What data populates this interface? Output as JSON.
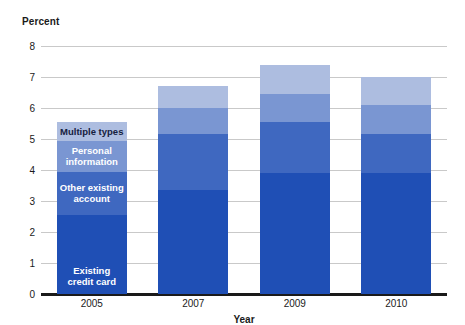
{
  "chart_data": {
    "type": "bar",
    "subtype": "stacked-bar",
    "title": "",
    "xlabel": "Year",
    "ylabel": "Percent",
    "categories": [
      "2005",
      "2007",
      "2009",
      "2010"
    ],
    "ylim": [
      0,
      8
    ],
    "yticks": [
      0,
      1,
      2,
      3,
      4,
      5,
      6,
      7,
      8
    ],
    "ytick_labels": [
      "0",
      "1",
      "2",
      "3",
      "4",
      "5",
      "6",
      "7",
      "8"
    ],
    "grid": true,
    "legend_position": "in-bar-2005",
    "series": [
      {
        "name": "Existing credit card",
        "color": "#1f4fb5",
        "values": [
          2.55,
          3.35,
          3.9,
          3.9
        ]
      },
      {
        "name": "Other existing account",
        "color": "#3f68c0",
        "values": [
          1.4,
          1.8,
          1.65,
          1.25
        ]
      },
      {
        "name": "Personal information",
        "color": "#7a96d2",
        "values": [
          1.0,
          0.85,
          0.9,
          0.95
        ]
      },
      {
        "name": "Multiple types",
        "color": "#adbde0",
        "values": [
          0.6,
          0.7,
          0.95,
          0.9
        ]
      }
    ],
    "totals": [
      5.55,
      6.7,
      7.4,
      7.0
    ]
  },
  "axis": {
    "y_title": "Percent",
    "x_title": "Year"
  },
  "labels": {
    "multiple_types": "Multiple types",
    "personal_information": "Personal\ninformation",
    "personal_information_line1": "Personal",
    "personal_information_line2": "information",
    "other_existing_account_line1": "Other existing",
    "other_existing_account_line2": "account",
    "existing_credit_card_line1": "Existing",
    "existing_credit_card_line2": "credit card"
  },
  "ticks": {
    "y": [
      "8",
      "7",
      "6",
      "5",
      "4",
      "3",
      "2",
      "1",
      "0"
    ],
    "x": [
      "2005",
      "2007",
      "2009",
      "2010"
    ]
  }
}
